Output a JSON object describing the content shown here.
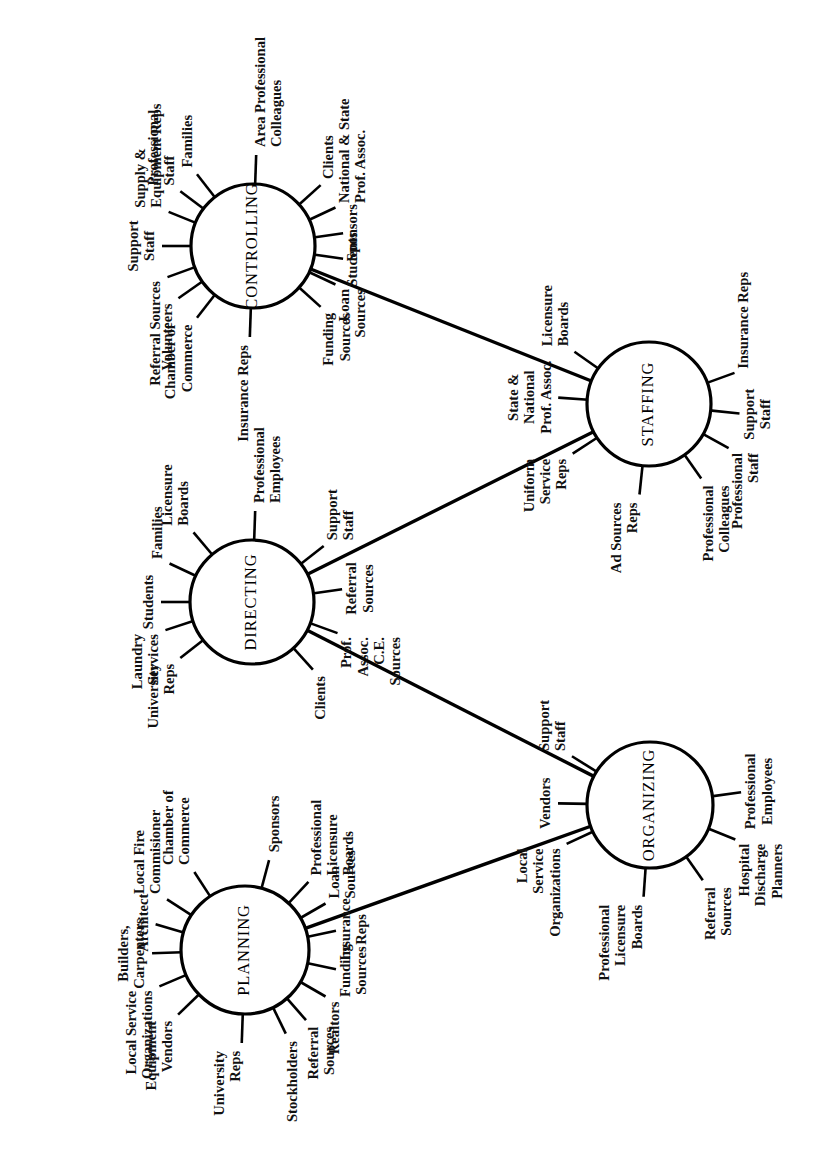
{
  "figure": {
    "type": "network-diagram",
    "orientation": "rotated-90-ccw",
    "background_color": "#ffffff",
    "line_color": "#000000",
    "node_count": 5,
    "node_shape": "circle"
  },
  "nodes": [
    {
      "id": "controlling",
      "label": "CONTROLLING",
      "cx": 253,
      "cy": 246,
      "r": 62,
      "spokes": [
        {
          "label": "Families",
          "lines": [
            "Families"
          ],
          "angle": 128
        },
        {
          "label": "Professional Staff",
          "lines": [
            "Professional",
            "Staff"
          ],
          "angle": 143
        },
        {
          "label": "Supply & Equipment Reps",
          "lines": [
            "Supply &",
            "Equipment Reps"
          ],
          "angle": 158
        },
        {
          "label": "Support Staff",
          "lines": [
            "Support",
            "Staff"
          ],
          "angle": 180
        },
        {
          "label": "Referral Sources",
          "lines": [
            "Referral Sources"
          ],
          "angle": 200
        },
        {
          "label": "Volunteers",
          "lines": [
            "Volunteers"
          ],
          "angle": 215
        },
        {
          "label": "Chamber of Commerce",
          "lines": [
            "Chamber of",
            "Commerce"
          ],
          "angle": 232
        },
        {
          "label": "Insurance Reps",
          "lines": [
            "Insurance Reps"
          ],
          "angle": 268
        },
        {
          "label": "Funding Sources",
          "lines": [
            "Funding",
            "Sources"
          ],
          "angle": 318
        },
        {
          "label": "Loan Sources",
          "lines": [
            "Loan",
            "Sources"
          ],
          "angle": 335
        },
        {
          "label": "Students",
          "lines": [
            "Students"
          ],
          "angle": 352
        },
        {
          "label": "Sponsors",
          "lines": [
            "Sponsors"
          ],
          "angle": 8
        },
        {
          "label": "National & State Prof. Assoc.",
          "lines": [
            "National & State",
            "Prof. Assoc."
          ],
          "angle": 25
        },
        {
          "label": "Clients",
          "lines": [
            "Clients"
          ],
          "angle": 42
        },
        {
          "label": "Area Professional Colleagues",
          "lines": [
            "Area Professional",
            "Colleagues"
          ],
          "angle": 88
        }
      ]
    },
    {
      "id": "staffing",
      "label": "STAFFING",
      "cx": 649,
      "cy": 404,
      "r": 62,
      "spokes": [
        {
          "label": "Licensure Boards",
          "lines": [
            "Licensure",
            "Boards"
          ],
          "angle": 145
        },
        {
          "label": "State & National Prof. Assoc.",
          "lines": [
            "State &",
            "National",
            "Prof. Assoc."
          ],
          "angle": 176
        },
        {
          "label": "Uniform Service Reps",
          "lines": [
            "Uniform",
            "Service",
            "Reps"
          ],
          "angle": 213
        },
        {
          "label": "Ad Sources Reps",
          "lines": [
            "Ad Sources",
            "Reps"
          ],
          "angle": 264
        },
        {
          "label": "Professional Colleagues",
          "lines": [
            "Professional",
            "Colleagues"
          ],
          "angle": 305
        },
        {
          "label": "Professional Staff",
          "lines": [
            "Professional",
            "Staff"
          ],
          "angle": 331
        },
        {
          "label": "Support Staff",
          "lines": [
            "Support",
            "Staff"
          ],
          "angle": 354
        },
        {
          "label": "Insurance Reps",
          "lines": [
            "Insurance Reps"
          ],
          "angle": 20
        }
      ]
    },
    {
      "id": "directing",
      "label": "DIRECTING",
      "cx": 252,
      "cy": 602,
      "r": 62,
      "spokes": [
        {
          "label": "Licensure Boards",
          "lines": [
            "Licensure",
            "Boards"
          ],
          "angle": 130
        },
        {
          "label": "Families",
          "lines": [
            "Families"
          ],
          "angle": 155
        },
        {
          "label": "Students",
          "lines": [
            "Students"
          ],
          "angle": 180
        },
        {
          "label": "Laundry Services",
          "lines": [
            "Laundry",
            "Services"
          ],
          "angle": 198
        },
        {
          "label": "University Reps",
          "lines": [
            "University",
            "Reps"
          ],
          "angle": 218
        },
        {
          "label": "Clients",
          "lines": [
            "Clients"
          ],
          "angle": 312
        },
        {
          "label": "Prof. Assoc. C.E. Sources",
          "lines": [
            "Prof.",
            "Assoc.",
            "C.E.",
            "Sources"
          ],
          "angle": 340
        },
        {
          "label": "Referral Sources",
          "lines": [
            "Referral",
            "Sources"
          ],
          "angle": 8
        },
        {
          "label": "Support Staff",
          "lines": [
            "Support",
            "Staff"
          ],
          "angle": 38
        },
        {
          "label": "Professional Employees",
          "lines": [
            "Professional",
            "Employees"
          ],
          "angle": 88
        }
      ]
    },
    {
      "id": "organizing",
      "label": "ORGANIZING",
      "cx": 650,
      "cy": 805,
      "r": 63,
      "spokes": [
        {
          "label": "Support Staff",
          "lines": [
            "Support",
            "Staff"
          ],
          "angle": 148
        },
        {
          "label": "Vendors",
          "lines": [
            "Vendors"
          ],
          "angle": 179
        },
        {
          "label": "Local Service Organizations",
          "lines": [
            "Local",
            "Service",
            "Organizations"
          ],
          "angle": 205
        },
        {
          "label": "Professional Licensure Boards",
          "lines": [
            "Professional",
            "Licensure",
            "Boards"
          ],
          "angle": 266
        },
        {
          "label": "Referral Sources",
          "lines": [
            "Referral",
            "Sources"
          ],
          "angle": 305
        },
        {
          "label": "Hospital Discharge Planners",
          "lines": [
            "Hospital",
            "Discharge",
            "Planners"
          ],
          "angle": 338
        },
        {
          "label": "Professional Employees",
          "lines": [
            "Professional",
            "Employees"
          ],
          "angle": 8
        }
      ]
    },
    {
      "id": "planning",
      "label": "PLANNING",
      "cx": 245,
      "cy": 950,
      "r": 64,
      "spokes": [
        {
          "label": "Chamber of Commerce",
          "lines": [
            "Chamber of",
            "Commerce"
          ],
          "angle": 123
        },
        {
          "label": "Local Fire Commisioner",
          "lines": [
            "Local Fire",
            "Commisioner"
          ],
          "angle": 147
        },
        {
          "label": "Architect",
          "lines": [
            "Architect"
          ],
          "angle": 164
        },
        {
          "label": "Builders, Carpenters",
          "lines": [
            "Builders,",
            "Carpenters"
          ],
          "angle": 182
        },
        {
          "label": "Local Service Organizations",
          "lines": [
            "Local Service",
            "Organizations"
          ],
          "angle": 203
        },
        {
          "label": "Equipment Vendors",
          "lines": [
            "Equipment",
            "Vendors"
          ],
          "angle": 224
        },
        {
          "label": "University Reps",
          "lines": [
            "University",
            "Reps"
          ],
          "angle": 268
        },
        {
          "label": "Stockholders",
          "lines": [
            "Stockholders"
          ],
          "angle": 296
        },
        {
          "label": "Referral Sources",
          "lines": [
            "Referral",
            "Sources"
          ],
          "angle": 311
        },
        {
          "label": "Realtors",
          "lines": [
            "Realtors"
          ],
          "angle": 330
        },
        {
          "label": "Funding Sources",
          "lines": [
            "Funding",
            "Sources"
          ],
          "angle": 348
        },
        {
          "label": "Insurance Reps",
          "lines": [
            "Insurance",
            "Reps"
          ],
          "angle": 12
        },
        {
          "label": "Loan Sources",
          "lines": [
            "Loan",
            "Sources"
          ],
          "angle": 30
        },
        {
          "label": "Professional Licensure Boards",
          "lines": [
            "Professional",
            "Licensure",
            "Boards"
          ],
          "angle": 47
        },
        {
          "label": "Sponsors",
          "lines": [
            "Sponsors"
          ],
          "angle": 75
        }
      ]
    }
  ],
  "connections": [
    {
      "from": "controlling",
      "to": "staffing"
    },
    {
      "from": "directing",
      "to": "staffing"
    },
    {
      "from": "directing",
      "to": "organizing"
    },
    {
      "from": "planning",
      "to": "organizing"
    }
  ]
}
